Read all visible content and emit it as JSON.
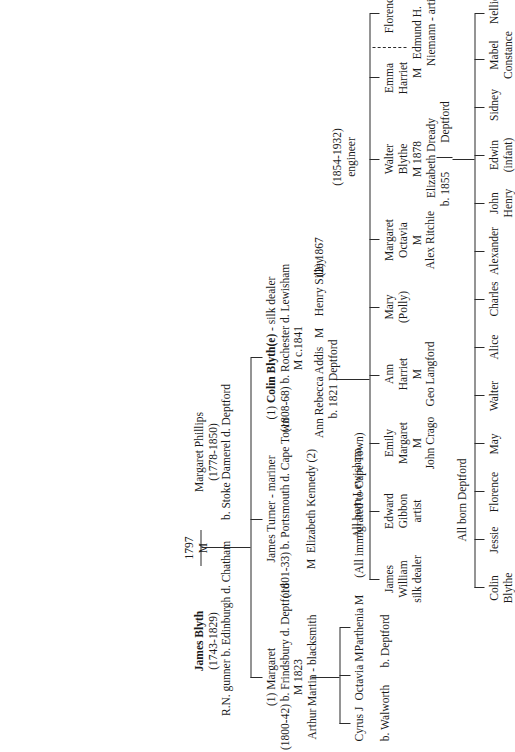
{
  "chart_title": "Blyth / Blythe family tree",
  "generation1": {
    "husband": {
      "name": "James Blyth",
      "dates": "(1743-1829)",
      "note": "R.N. gunner b. Edinburgh d. Chatham"
    },
    "marriage": {
      "symbol": "M",
      "year": "1797"
    },
    "wife": {
      "name": "Margaret Phillips",
      "dates": "(1778-1850)",
      "note": "b. Stoke Damerel d. Deptford"
    }
  },
  "generation2": {
    "children": [
      {
        "order": "(1) Margaret",
        "dates_place": "(1800-42) b. Frindsbury d. Deptford",
        "marriage": "M 1823",
        "spouse": "Arthur Martin - blacksmith"
      },
      {
        "name": "James Turner - mariner",
        "dates_place": "(1801-33) b. Portsmouth d. Cape Town",
        "marriage_symbol": "M",
        "spouse": "Elizabeth Kennedy (2)"
      },
      {
        "order": "(1)",
        "name": "Colin Blyth(e)",
        "occupation": "- silk dealer",
        "dates_place": "(1808-68) b. Rochester d. Lewisham",
        "marriage": "M c.1841",
        "spouse": "Ann Rebecca Addis",
        "spouse_dates": "b. 1821  Deptford",
        "marriage_symbol2": "M",
        "spouse2": "Henry Silley",
        "marriage2": "(2) 1867"
      }
    ]
  },
  "generation3": {
    "martin_children": {
      "names": [
        "Cyrus J",
        "Octavia M",
        "Parthenia M"
      ],
      "note": "(All immigrated to Cape Town)",
      "birthplaces": [
        "b. Walworth",
        "b. Deptford"
      ]
    },
    "blythe_children_note": "All born Lewisham",
    "children": [
      {
        "lines": [
          "James",
          "William",
          "silk dealer"
        ]
      },
      {
        "lines": [
          "Edward",
          "Gibbon",
          "artist"
        ]
      },
      {
        "lines": [
          "Emily",
          "Margaret",
          "M",
          "John Crago"
        ]
      },
      {
        "lines": [
          "Ann",
          "Harriet",
          "M",
          "Geo Langford"
        ]
      },
      {
        "lines": [
          "Mary",
          "(Polly)"
        ]
      },
      {
        "lines": [
          "Margaret",
          "Octavia",
          "M",
          "Alex Ritchie"
        ]
      },
      {
        "lines": [
          "Walter",
          "Blythe"
        ],
        "bold": true,
        "dates": "(1854-1932)",
        "occupation": "engineer",
        "marriage": "M 1878",
        "spouse": "Elizabeth Dready",
        "spouse_dates": "b. 1855",
        "spouse_place": "Deptford"
      },
      {
        "lines": [
          "Emma",
          "Harriet",
          "M",
          "Edmund H.",
          "Niemann - artist"
        ]
      },
      {
        "lines": [
          "Florence"
        ]
      }
    ]
  },
  "generation4": {
    "note": "All born Deptford",
    "children": [
      {
        "lines": [
          "Colin",
          "Blythe"
        ],
        "bold": true
      },
      {
        "lines": [
          "Jessie"
        ]
      },
      {
        "lines": [
          "Florence"
        ]
      },
      {
        "lines": [
          "May"
        ]
      },
      {
        "lines": [
          "Walter"
        ]
      },
      {
        "lines": [
          "Alice"
        ]
      },
      {
        "lines": [
          "Charles"
        ]
      },
      {
        "lines": [
          "Alexander"
        ]
      },
      {
        "lines": [
          "John",
          "Henry"
        ]
      },
      {
        "lines": [
          "Edwin",
          "(infant)"
        ]
      },
      {
        "lines": [
          "Sidney"
        ]
      },
      {
        "lines": [
          "Mabel",
          "Constance"
        ]
      },
      {
        "lines": [
          "Nellie"
        ]
      }
    ]
  },
  "colors": {
    "ink": "#1a1a1a",
    "rule": "#2b2b2b",
    "page": "#ffffff"
  }
}
